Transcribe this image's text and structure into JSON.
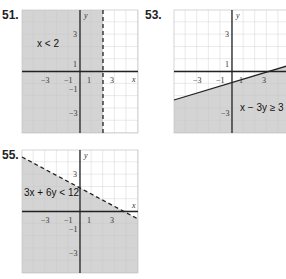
{
  "problems": [
    {
      "number": "51.",
      "inequality": "x < 2",
      "boundary": "dashed",
      "shade": "left of x = 2"
    },
    {
      "number": "53.",
      "inequality": "x − 3y ≥ 3",
      "boundary": "solid",
      "shade": "below line"
    },
    {
      "number": "55.",
      "inequality": "3x + 6y < 12",
      "boundary": "dashed",
      "shade": "below line"
    }
  ],
  "axes": {
    "x_label": "x",
    "y_label": "y",
    "x_ticks": [
      "−3",
      "−1",
      "1",
      "3"
    ],
    "y_ticks": [
      "3",
      "1",
      "−1",
      "−3"
    ]
  },
  "colors": {
    "shade": "#d4d4d4",
    "grid": "#b8b8b8",
    "axis": "#222222"
  }
}
